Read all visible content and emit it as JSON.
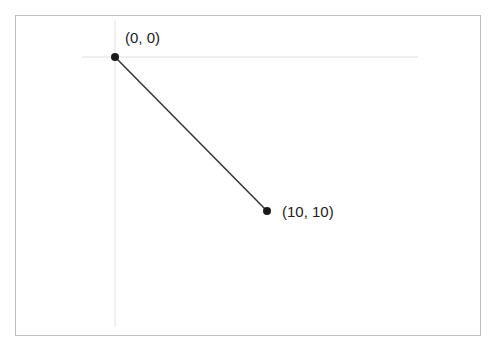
{
  "diagram": {
    "points": [
      {
        "label": "(0, 0)",
        "x": 0,
        "y": 0
      },
      {
        "label": "(10, 10)",
        "x": 10,
        "y": 10
      }
    ],
    "colors": {
      "axis": "#e0e0e0",
      "line": "#333333",
      "point": "#1a1a1a",
      "frame": "#bdbdbd"
    }
  }
}
